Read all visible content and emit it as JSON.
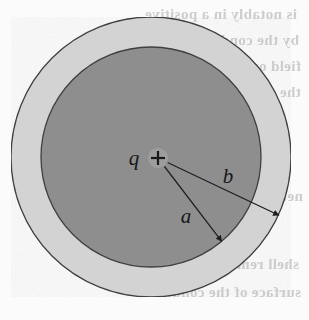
{
  "figure": {
    "name": "spherical-shell-point-charge-diagram",
    "width": 309,
    "height": 320,
    "background_color": "#fbfbfb",
    "description_labels": {
      "charge_label": "q",
      "charge_sign": "+",
      "inner_radius_label": "a",
      "outer_radius_label": "b"
    },
    "geometry": {
      "center_x": 151,
      "center_y": 157,
      "inner_circle_radius": 110,
      "outer_circle_radius": 140,
      "charge_dot_radius": 10,
      "inner_fill_color": "#8e8e8e",
      "outer_fill_color": "#d3d3d3",
      "stroke_color": "#3c3c3c",
      "charge_dot_fill": "#9a9a9a"
    },
    "arrows": [
      {
        "name": "radius-a-arrow",
        "label": "a",
        "angle_deg": 52,
        "length": 110,
        "label_x": 186,
        "label_y": 222
      },
      {
        "name": "radius-b-arrow",
        "label": "b",
        "angle_deg": 25,
        "length": 140,
        "label_x": 228,
        "label_y": 182
      }
    ],
    "bleed_through_text": [
      {
        "text": "is notably in a positive",
        "x": 12,
        "y": 18,
        "size": 15
      },
      {
        "text": "by the conducting shell",
        "x": 10,
        "y": 44,
        "size": 15
      },
      {
        "text": "field outside",
        "x": 8,
        "y": 70,
        "size": 15
      },
      {
        "text": "the",
        "x": 8,
        "y": 96,
        "size": 15
      },
      {
        "text": "net",
        "x": 6,
        "y": 200,
        "size": 15
      },
      {
        "text": "shell remains at",
        "x": 10,
        "y": 268,
        "size": 15
      },
      {
        "text": "surface of the conductor",
        "x": 8,
        "y": 296,
        "size": 15
      }
    ]
  }
}
